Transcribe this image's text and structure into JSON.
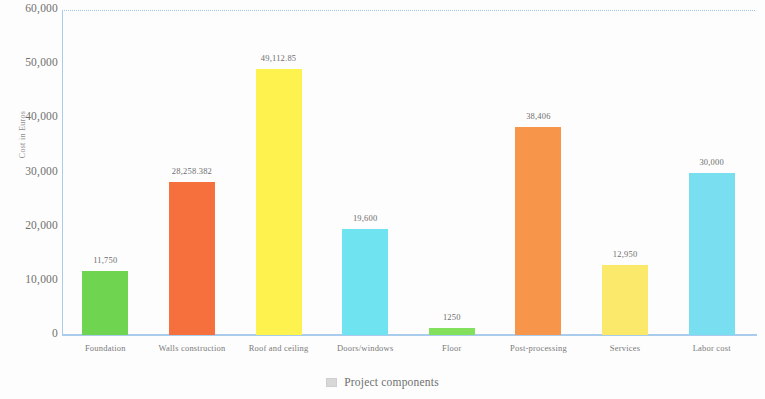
{
  "chart_data": {
    "type": "bar",
    "title": "",
    "xlabel": "Project components",
    "ylabel": "Cost in Euros",
    "ylim": [
      0,
      60000
    ],
    "grid": false,
    "legend_position": "bottom",
    "legend_entries": [
      "Project components"
    ],
    "categories": [
      "Foundation",
      "Walls construction",
      "Roof and ceiling",
      "Doors/windows",
      "Floor",
      "Post-processing",
      "Services",
      "Labor cost"
    ],
    "values": [
      11750,
      28258.382,
      49112.85,
      19600,
      1250,
      38406,
      12950,
      30000
    ],
    "data_labels": [
      "11,750",
      "28,258.382",
      "49,112.85",
      "19,600",
      "1250",
      "38,406",
      "12,950",
      "30,000"
    ],
    "bar_colors": [
      "#6fd44f",
      "#f5703c",
      "#fdf24e",
      "#6fe3f0",
      "#83e05c",
      "#f7954a",
      "#fbe96b",
      "#79dff0"
    ],
    "y_ticks": [
      "0",
      "10,000",
      "20,000",
      "30,000",
      "40,000",
      "50,000",
      "60,000"
    ],
    "y_tick_values": [
      0,
      10000,
      20000,
      30000,
      40000,
      50000,
      60000
    ]
  },
  "axis_color": "#a9cced",
  "legend_swatch_color": "#d8d8d8"
}
